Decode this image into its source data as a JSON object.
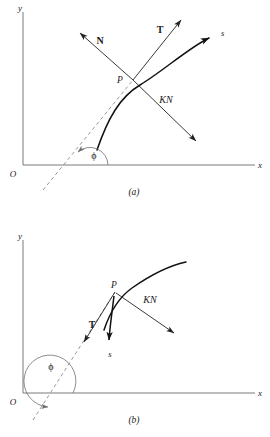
{
  "figure": {
    "panels": [
      {
        "caption": "(a)",
        "axes": {
          "x_label": "x",
          "y_label": "y",
          "origin_label": "O"
        },
        "angle_label": "ϕ",
        "point_label": "P",
        "arc_label": "s",
        "vectors": [
          {
            "name": "normal",
            "label": "N"
          },
          {
            "name": "tangent",
            "label": "T"
          },
          {
            "name": "curvature-force",
            "label": "KN"
          }
        ]
      },
      {
        "caption": "(b)",
        "axes": {
          "x_label": "x",
          "y_label": "y",
          "origin_label": "O"
        },
        "angle_label": "ϕ",
        "point_label": "P",
        "arc_label": "s",
        "vectors": [
          {
            "name": "tangent",
            "label": "T"
          },
          {
            "name": "curvature-force",
            "label": "KN"
          }
        ]
      }
    ],
    "colors": {
      "ink": "#111111",
      "axis": "#7a7a7a",
      "dashed": "#8c8c8c",
      "background": "#ffffff"
    }
  }
}
